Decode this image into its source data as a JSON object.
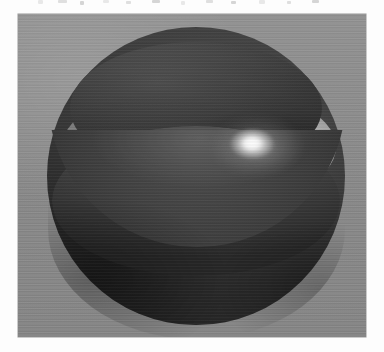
{
  "page": {
    "background_color": "#fdfdfd",
    "width": 384,
    "height": 352,
    "caption": ""
  },
  "scan_artifacts": {
    "description": "faint cut-off text remnants along the top edge",
    "marks": [
      {
        "left": 38,
        "top": 0,
        "width": 5,
        "height": 4
      },
      {
        "left": 58,
        "top": 0,
        "width": 9,
        "height": 3
      },
      {
        "left": 80,
        "top": 1,
        "width": 4,
        "height": 4
      },
      {
        "left": 103,
        "top": 0,
        "width": 6,
        "height": 3
      },
      {
        "left": 126,
        "top": 1,
        "width": 5,
        "height": 3
      },
      {
        "left": 152,
        "top": 0,
        "width": 8,
        "height": 3
      },
      {
        "left": 181,
        "top": 1,
        "width": 4,
        "height": 4
      },
      {
        "left": 206,
        "top": 0,
        "width": 7,
        "height": 3
      },
      {
        "left": 231,
        "top": 1,
        "width": 5,
        "height": 3
      },
      {
        "left": 259,
        "top": 0,
        "width": 6,
        "height": 4
      },
      {
        "left": 287,
        "top": 1,
        "width": 4,
        "height": 3
      },
      {
        "left": 312,
        "top": 0,
        "width": 7,
        "height": 3
      }
    ]
  },
  "image_panel": {
    "name": "rendered-figure",
    "background_color": "#8e8e8e",
    "left": 18,
    "top": 14,
    "width": 348,
    "height": 323
  },
  "figure": {
    "renderer_look": "grayscale raster render",
    "sphere": {
      "name": "sphere-body",
      "center_x": 196,
      "center_y": 176,
      "radius_x": 149,
      "radius_y": 149,
      "base_color": "#3f3f3f",
      "dark_color": "#2b2b2b",
      "light_color": "#585858"
    },
    "crater": {
      "name": "crater-interior",
      "center_x": 196,
      "center_y": 108,
      "radius_x": 126,
      "radius_y": 66,
      "interior_color": "#343434"
    },
    "bright_band": {
      "name": "bright-band",
      "center_x": 199,
      "center_y": 147,
      "radius_x": 137,
      "radius_y": 63,
      "highlight_color": "#f2f2f2",
      "mid_color": "#b8b8b8",
      "shadow_color": "#7c7c7c"
    },
    "specular_highlight": {
      "name": "specular-highlight",
      "center_x": 252,
      "center_y": 145,
      "color": "#ffffff",
      "radius": 23
    },
    "light_direction": "upper right"
  },
  "palette": {
    "page_white": "#fdfdfd",
    "panel_gray": "#8e8e8e",
    "sphere_dark": "#2b2b2b",
    "sphere_mid": "#3f3f3f",
    "band_bright": "#f2f2f2",
    "highlight_white": "#ffffff"
  }
}
